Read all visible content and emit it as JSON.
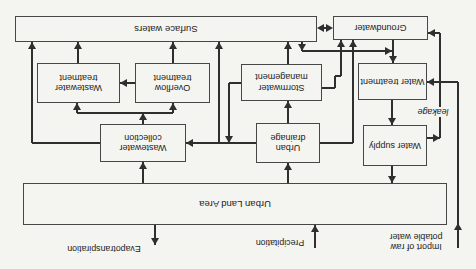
{
  "boxes": {
    "surface_waters": "Surface waters",
    "groundwater": "Groundwater",
    "wastewater_treatment": "Wastewater treatment",
    "overflow_treatment": "Overflow treatment",
    "stormwater_management": "Stormwater management",
    "water_treatment": "Water treatment",
    "wastewater_collection": "Wastewater collection",
    "urban_drainage": "Urban drainage",
    "water_supply": "Water supply",
    "urban_land_area": "Urban Land Area"
  },
  "labels": {
    "evapotranspiration": "Evapotranspiration",
    "precipitation": "Precipitation",
    "import_line1": "Import of raw",
    "import_line2": "potable water",
    "leakage": "leakage"
  },
  "colors": {
    "line": "#2f2f2f",
    "box_border": "#474747",
    "background": "#f4f4f1",
    "text": "#222222"
  }
}
